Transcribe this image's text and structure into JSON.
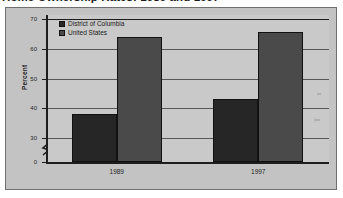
{
  "title": "Home Ownership Rates: 1989 and 1997",
  "legend": {
    "items": [
      {
        "label": "District of Columbia",
        "key": "dc",
        "color": "#262626"
      },
      {
        "label": "United States",
        "key": "us",
        "color": "#4a4a4a"
      }
    ]
  },
  "axes": {
    "y_title": "Percent",
    "y_ticks": [
      "0",
      "30",
      "40",
      "50",
      "60",
      "70"
    ],
    "x_labels": [
      "1989",
      "1997"
    ]
  },
  "chart_data": {
    "type": "bar",
    "title": "Home Ownership Rates: 1989 and 1997",
    "xlabel": "",
    "ylabel": "Percent",
    "categories": [
      "1989",
      "1997"
    ],
    "series": [
      {
        "name": "District of Columbia",
        "values": [
          38,
          43
        ],
        "color": "#262626"
      },
      {
        "name": "United States",
        "values": [
          64,
          65.5
        ],
        "color": "#4a4a4a"
      }
    ],
    "ylim": [
      0,
      70
    ],
    "yticks": [
      0,
      30,
      40,
      50,
      60,
      70
    ],
    "axis_break": true,
    "axis_break_between": [
      0,
      30
    ],
    "grid": true,
    "legend_position": "top-left"
  }
}
